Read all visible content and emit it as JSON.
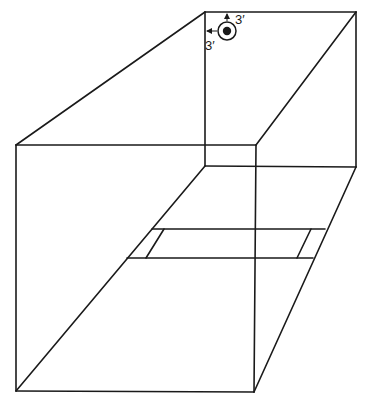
{
  "diagram": {
    "type": "room-perspective",
    "fixture": {
      "icon": "ceiling-light-icon",
      "offset_from_top_wall": "3′",
      "offset_from_left_wall": "3′"
    },
    "labels": {
      "top_offset": "3′",
      "left_offset": "3′"
    },
    "colors": {
      "line": "#1a1a1a",
      "background": "#ffffff"
    }
  }
}
